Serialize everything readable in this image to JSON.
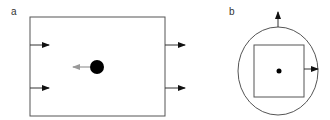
{
  "panels": [
    {
      "label": "a",
      "description": "Rectangular box with two inward arrows on the left edge, two outward arrows on the right edge, and a black ball with a gray arrow pointing left"
    },
    {
      "label": "b",
      "description": "Circle enclosing a square with a central dot; arrow pointing up from top of circle and arrow pointing right from the square's right edge"
    }
  ],
  "colors": {
    "line": "#555555",
    "arrow": "#111111",
    "ball": "#000000",
    "velocity_arrow": "#999999"
  }
}
